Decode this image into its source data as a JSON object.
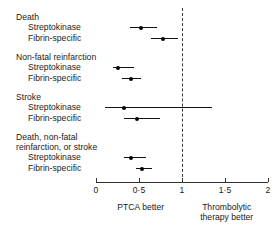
{
  "chart_data": {
    "type": "scatter",
    "subtype": "forest-plot",
    "title": "",
    "xlabel": "",
    "ylabel": "",
    "xlim": [
      0,
      2
    ],
    "grid": false,
    "null_value": 1,
    "effect_measure": "odds ratio",
    "tick_labels": [
      "0",
      "0·5",
      "1",
      "1·5",
      "2"
    ],
    "tick_values": [
      0,
      0.5,
      1,
      1.5,
      2
    ],
    "left_caption": "PTCA better",
    "right_caption_line1": "Thrombolytic",
    "right_caption_line2": "therapy better",
    "groups": [
      {
        "name": "Death",
        "name_line1": "Death",
        "name_line2": "",
        "rows": [
          {
            "label": "Streptokinase",
            "estimate": 0.52,
            "ci_low": 0.39,
            "ci_high": 0.71
          },
          {
            "label": "Fibrin-specific",
            "estimate": 0.78,
            "ci_low": 0.64,
            "ci_high": 0.95
          }
        ]
      },
      {
        "name": "Non-fatal reinfarction",
        "name_line1": "Non-fatal reinfarction",
        "name_line2": "",
        "rows": [
          {
            "label": "Streptokinase",
            "estimate": 0.25,
            "ci_low": 0.2,
            "ci_high": 0.44
          },
          {
            "label": "Fibrin-specific",
            "estimate": 0.41,
            "ci_low": 0.3,
            "ci_high": 0.52
          }
        ]
      },
      {
        "name": "Stroke",
        "name_line1": "Stroke",
        "name_line2": "",
        "rows": [
          {
            "label": "Streptokinase",
            "estimate": 0.32,
            "ci_low": 0.1,
            "ci_high": 1.35
          },
          {
            "label": "Fibrin-specific",
            "estimate": 0.48,
            "ci_low": 0.32,
            "ci_high": 0.75
          }
        ]
      },
      {
        "name": "Death, non-fatal reinfarction, or stroke",
        "name_line1": "Death, non-fatal",
        "name_line2": "reinfarction, or stroke",
        "rows": [
          {
            "label": "Streptokinase",
            "estimate": 0.41,
            "ci_low": 0.32,
            "ci_high": 0.58
          },
          {
            "label": "Fibrin-specific",
            "estimate": 0.53,
            "ci_low": 0.46,
            "ci_high": 0.65
          }
        ]
      }
    ]
  },
  "colors": {
    "point": "#000000",
    "line": "#111111",
    "axis": "#333333",
    "null_line": "#3a3a3a",
    "text": "#1a1a1a",
    "background": "#ffffff"
  }
}
